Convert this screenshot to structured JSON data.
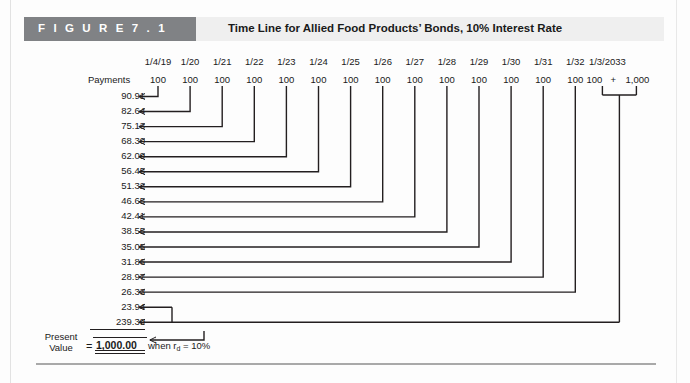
{
  "figure": {
    "tag": "F I G U R E   7 . 1",
    "title": "Time Line for Allied Food Products’ Bonds, 10% Interest Rate"
  },
  "timeline": {
    "payments_label": "Payments",
    "dates": [
      "1/4/19",
      "1/20",
      "1/21",
      "1/22",
      "1/23",
      "1/24",
      "1/25",
      "1/26",
      "1/27",
      "1/28",
      "1/29",
      "1/30",
      "1/31",
      "1/32",
      "1/3/2033"
    ],
    "payment_values": [
      "100",
      "100",
      "100",
      "100",
      "100",
      "100",
      "100",
      "100",
      "100",
      "100",
      "100",
      "100",
      "100",
      "100",
      "100"
    ],
    "final_plus": "+",
    "final_principal": "1,000"
  },
  "present_values": [
    "90.91",
    "82.64",
    "75.13",
    "68.30",
    "62.09",
    "56.45",
    "51.32",
    "46.65",
    "42.41",
    "38.55",
    "35.05",
    "31.86",
    "28.97",
    "26.33",
    "23.94",
    "239.39"
  ],
  "summary": {
    "label_line1": "Present",
    "label_line2": "Value",
    "equals": "=",
    "amount": "1,000.00",
    "when_text_pre": "when r",
    "when_sub": "d",
    "when_text_post": " = 10%"
  },
  "chart_data": {
    "type": "bar",
    "title": "Time Line for Allied Food Products’ Bonds, 10% Interest Rate",
    "xlabel": "Date",
    "ylabel": "Present Value of Cash Flow",
    "categories": [
      "1/4/19",
      "1/20",
      "1/21",
      "1/22",
      "1/23",
      "1/24",
      "1/25",
      "1/26",
      "1/27",
      "1/28",
      "1/29",
      "1/30",
      "1/31",
      "1/32",
      "1/3/2033"
    ],
    "series": [
      {
        "name": "Cash Flow (Payment)",
        "values": [
          100,
          100,
          100,
          100,
          100,
          100,
          100,
          100,
          100,
          100,
          100,
          100,
          100,
          100,
          1100
        ]
      },
      {
        "name": "Discounted Present Value",
        "values": [
          90.91,
          82.64,
          75.13,
          68.3,
          62.09,
          56.45,
          51.32,
          46.65,
          42.41,
          38.55,
          35.05,
          31.86,
          28.97,
          26.33,
          263.33
        ]
      }
    ],
    "annotations": [
      "Interest rate r_d = 10%",
      "Final period cash flow = 100 + 1,000",
      "PV of year-15 coupon = 23.94",
      "PV of year-15 principal = 239.39",
      "Total Present Value = 1,000.00"
    ],
    "grid": false,
    "legend": "none"
  }
}
